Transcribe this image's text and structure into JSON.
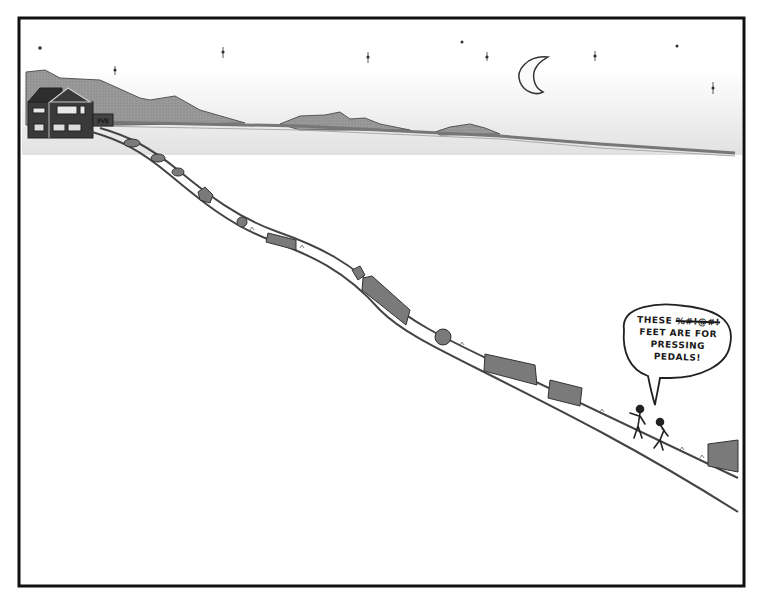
{
  "cartoon": {
    "speech_bubble": {
      "line1_prefix": "THESE",
      "line1_censored": "%#!@#!",
      "line2": "FEET ARE FOR",
      "line3": "PRESSING",
      "line4": "PEDALS!"
    },
    "house": {
      "sign": "FVE"
    },
    "colors": {
      "frame": "#111111",
      "ink": "#2a2a2a",
      "hills": "#8a8a8a",
      "sky_shade": "#d8d8d8",
      "bush": "#6a6a6a"
    }
  }
}
